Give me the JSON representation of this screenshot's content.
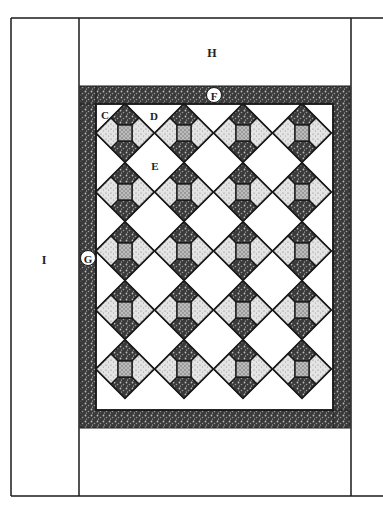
{
  "diagram": {
    "type": "quilt-layout",
    "grid": {
      "columns": 4,
      "rows": 5
    },
    "labels": {
      "H": "H",
      "I": "I",
      "F": "F",
      "G": "G",
      "C": "C",
      "D": "D",
      "E": "E"
    },
    "colors": {
      "line": "#1a1a1a",
      "dark_print": "#3a3a3a",
      "light_print": "#cfcfcf",
      "background": "#ffffff"
    }
  }
}
